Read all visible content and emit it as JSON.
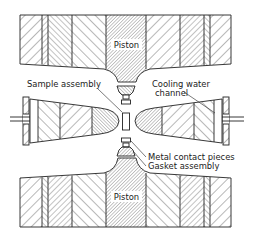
{
  "figure": {
    "colors": {
      "line": "#222222",
      "background": "#ffffff"
    }
  },
  "labels": {
    "piston_top": "Piston",
    "piston_bottom": "Piston",
    "sample_assembly": "Sample assembly",
    "cooling_water_line1": "Cooling water",
    "cooling_water_line2": "channel",
    "metal_contact": "Metal contact pieces",
    "gasket_assembly": "Gasket assembly"
  },
  "components": [
    {
      "name": "upper-block",
      "hatch": "banded"
    },
    {
      "name": "upper-piston",
      "hatch": "fine-diagonal"
    },
    {
      "name": "middle-ring",
      "hatch": "banded"
    },
    {
      "name": "sample-assembly",
      "hatch": "none"
    },
    {
      "name": "lower-block",
      "hatch": "banded"
    },
    {
      "name": "lower-piston",
      "hatch": "fine-diagonal"
    }
  ]
}
